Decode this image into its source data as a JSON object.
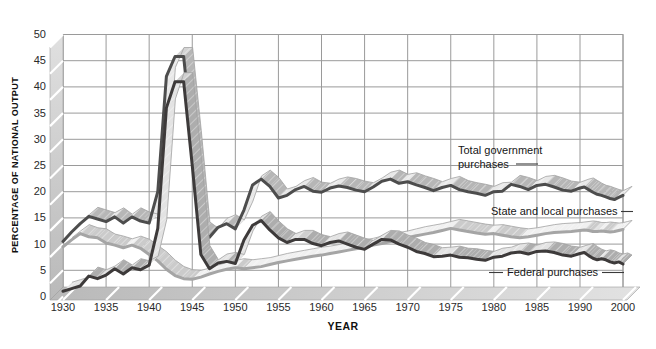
{
  "chart_data": {
    "type": "line",
    "style": "3d-ribbon-grayscale",
    "x_label": "YEAR",
    "y_label": "PERCENTAGE OF NATIONAL OUTPUT",
    "x_tick_labels": [
      "1930",
      "1935",
      "1940",
      "1945",
      "1950",
      "1955",
      "1960",
      "1965",
      "1970",
      "1975",
      "1980",
      "1985",
      "1990",
      "2000"
    ],
    "y_ticks": [
      0,
      5,
      10,
      15,
      20,
      25,
      30,
      35,
      40,
      45,
      50
    ],
    "ylim": [
      0,
      50
    ],
    "grid": true,
    "grid_color": "#9a9a9a",
    "band_color": "#c9c9c9",
    "years": [
      1930,
      1931,
      1932,
      1933,
      1934,
      1935,
      1936,
      1937,
      1938,
      1939,
      1940,
      1941,
      1942,
      1943,
      1944,
      1945,
      1946,
      1947,
      1948,
      1949,
      1950,
      1951,
      1952,
      1953,
      1954,
      1955,
      1956,
      1957,
      1958,
      1959,
      1960,
      1961,
      1962,
      1963,
      1964,
      1965,
      1966,
      1967,
      1968,
      1969,
      1970,
      1971,
      1972,
      1973,
      1974,
      1975,
      1976,
      1977,
      1978,
      1979,
      1980,
      1981,
      1982,
      1983,
      1984,
      1985,
      1986,
      1987,
      1988,
      1989,
      1990,
      1991,
      1992,
      1993,
      1994,
      1995,
      1996,
      1997,
      1998,
      1999,
      2000
    ],
    "series": [
      {
        "id": "total",
        "name": "Total government purchases",
        "line_color": "#4d4d4d",
        "values": [
          10.5,
          12.3,
          13.9,
          15.3,
          14.8,
          14.3,
          15.2,
          14.0,
          15.2,
          14.4,
          14.0,
          20.0,
          42.0,
          45.8,
          45.8,
          30.0,
          12.5,
          11.3,
          13.2,
          13.9,
          12.9,
          16.5,
          21.3,
          22.4,
          21.0,
          18.8,
          19.3,
          20.4,
          21.0,
          20.1,
          19.9,
          20.7,
          21.1,
          20.8,
          20.3,
          20.0,
          20.9,
          22.0,
          22.4,
          21.6,
          21.9,
          21.3,
          20.8,
          20.2,
          20.8,
          21.2,
          20.4,
          20.0,
          19.7,
          19.3,
          20.0,
          20.1,
          21.4,
          21.0,
          20.4,
          21.2,
          21.4,
          20.9,
          20.3,
          20.1,
          20.7,
          20.9,
          20.4,
          19.9,
          19.5,
          19.3,
          19.0,
          18.7,
          18.5,
          18.9,
          19.3
        ]
      },
      {
        "id": "state_local",
        "name": "State and local purchases",
        "line_color": "#a5a5a5",
        "values": [
          9.5,
          10.8,
          12.0,
          11.4,
          11.2,
          10.2,
          9.8,
          9.3,
          9.8,
          9.2,
          8.0,
          6.8,
          5.2,
          4.0,
          3.4,
          3.3,
          3.7,
          4.3,
          4.8,
          5.2,
          5.5,
          5.3,
          5.5,
          5.7,
          6.1,
          6.5,
          6.8,
          7.1,
          7.4,
          7.7,
          7.9,
          8.2,
          8.5,
          8.8,
          9.1,
          9.4,
          9.8,
          10.1,
          10.5,
          10.8,
          11.2,
          11.6,
          11.9,
          12.2,
          12.6,
          13.0,
          12.7,
          12.4,
          12.1,
          11.9,
          12.0,
          11.7,
          11.4,
          11.2,
          11.4,
          11.7,
          12.0,
          12.2,
          12.3,
          12.4,
          12.6,
          12.7,
          12.6,
          12.4,
          12.4,
          12.5,
          12.4,
          12.3,
          12.4,
          12.6,
          12.8
        ]
      },
      {
        "id": "federal",
        "name": "Federal purchases",
        "line_color": "#3d3a3a",
        "values": [
          1.0,
          1.5,
          2.0,
          3.9,
          3.4,
          4.1,
          5.3,
          4.3,
          5.5,
          5.1,
          6.0,
          13.0,
          36.0,
          41.0,
          41.0,
          25.0,
          8.0,
          5.3,
          6.4,
          6.7,
          6.3,
          10.8,
          13.6,
          14.5,
          12.7,
          11.2,
          10.3,
          10.9,
          10.9,
          10.1,
          9.7,
          10.3,
          10.6,
          10.0,
          9.4,
          9.0,
          10.0,
          10.9,
          10.8,
          10.0,
          9.4,
          8.6,
          8.2,
          7.6,
          7.7,
          7.9,
          7.5,
          7.4,
          7.1,
          6.9,
          7.5,
          7.7,
          8.3,
          8.5,
          8.1,
          8.6,
          8.7,
          8.4,
          7.9,
          7.7,
          8.2,
          8.4,
          7.8,
          7.3,
          7.0,
          7.2,
          7.0,
          6.6,
          6.4,
          6.6,
          6.2
        ]
      }
    ]
  }
}
